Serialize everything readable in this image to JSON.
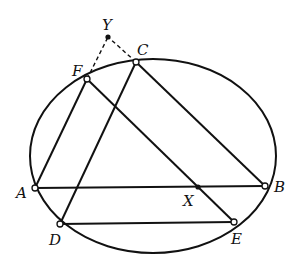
{
  "figure": {
    "type": "conic-ellipse-construction",
    "ellipse": {
      "cx": 153,
      "cy": 156,
      "rx": 123,
      "ry": 97
    },
    "points": {
      "A": {
        "label": "A",
        "x": 35,
        "y": 188,
        "style": "open",
        "lx": 16,
        "ly": 198
      },
      "B": {
        "label": "B",
        "x": 265,
        "y": 186,
        "style": "open",
        "lx": 274,
        "ly": 192
      },
      "C": {
        "label": "C",
        "x": 136,
        "y": 62,
        "style": "open",
        "lx": 137,
        "ly": 55
      },
      "D": {
        "label": "D",
        "x": 60,
        "y": 224,
        "style": "open",
        "lx": 49,
        "ly": 245
      },
      "E": {
        "label": "E",
        "x": 234,
        "y": 222,
        "style": "open",
        "lx": 231,
        "ly": 244
      },
      "F": {
        "label": "F",
        "x": 87,
        "y": 79,
        "style": "open",
        "lx": 72,
        "ly": 76
      },
      "X": {
        "label": "X",
        "x": 198,
        "y": 187,
        "style": "solid",
        "lx": 183,
        "ly": 206
      },
      "Y": {
        "label": "Y",
        "x": 108,
        "y": 37,
        "style": "solid",
        "lx": 102,
        "ly": 30
      }
    },
    "segments": [
      {
        "from": "A",
        "to": "B",
        "style": "solid"
      },
      {
        "from": "A",
        "to": "F",
        "style": "solid"
      },
      {
        "from": "C",
        "to": "B",
        "style": "solid"
      },
      {
        "from": "C",
        "to": "D",
        "style": "solid"
      },
      {
        "from": "D",
        "to": "E",
        "style": "solid"
      },
      {
        "from": "F",
        "to": "E",
        "style": "solid"
      },
      {
        "from": "F",
        "to": "Y",
        "style": "dashed"
      },
      {
        "from": "C",
        "to": "Y",
        "style": "dashed"
      }
    ]
  }
}
